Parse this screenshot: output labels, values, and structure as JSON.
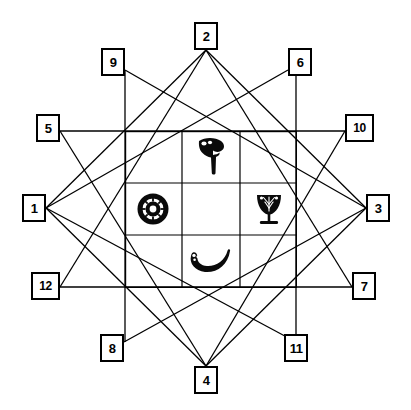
{
  "diagram": {
    "background_color": "#ffffff",
    "line_color": "#000000",
    "box_border_color": "#000000",
    "box_fill_color": "#ffffff"
  },
  "nodes": [
    {
      "id": "node-1",
      "label": "1",
      "x": 22,
      "y": 194,
      "w": 24,
      "h": 28,
      "anchor_x": 46,
      "anchor_y": 208
    },
    {
      "id": "node-2",
      "label": "2",
      "x": 194,
      "y": 22,
      "w": 24,
      "h": 28,
      "anchor_x": 206,
      "anchor_y": 50
    },
    {
      "id": "node-3",
      "label": "3",
      "x": 366,
      "y": 194,
      "w": 24,
      "h": 28,
      "anchor_x": 366,
      "anchor_y": 208
    },
    {
      "id": "node-4",
      "label": "4",
      "x": 194,
      "y": 366,
      "w": 24,
      "h": 28,
      "anchor_x": 206,
      "anchor_y": 366
    },
    {
      "id": "node-5",
      "label": "5",
      "x": 36,
      "y": 114,
      "w": 24,
      "h": 28,
      "anchor_x": 60,
      "anchor_y": 131
    },
    {
      "id": "node-6",
      "label": "6",
      "x": 288,
      "y": 48,
      "w": 24,
      "h": 28,
      "anchor_x": 288,
      "anchor_y": 70
    },
    {
      "id": "node-7",
      "label": "7",
      "x": 352,
      "y": 272,
      "w": 24,
      "h": 28,
      "anchor_x": 352,
      "anchor_y": 287
    },
    {
      "id": "node-8",
      "label": "8",
      "x": 100,
      "y": 334,
      "w": 24,
      "h": 28,
      "anchor_x": 124,
      "anchor_y": 342
    },
    {
      "id": "node-9",
      "label": "9",
      "x": 101,
      "y": 48,
      "w": 24,
      "h": 28,
      "anchor_x": 125,
      "anchor_y": 70
    },
    {
      "id": "node-10",
      "label": "10",
      "x": 345,
      "y": 114,
      "w": 29,
      "h": 28,
      "anchor_x": 345,
      "anchor_y": 131
    },
    {
      "id": "node-11",
      "label": "11",
      "x": 284,
      "y": 334,
      "w": 24,
      "h": 28,
      "anchor_x": 296,
      "anchor_y": 342
    },
    {
      "id": "node-12",
      "label": "12",
      "x": 31,
      "y": 272,
      "w": 29,
      "h": 28,
      "anchor_x": 60,
      "anchor_y": 287
    }
  ],
  "connections": [
    {
      "from": "5",
      "to": "10",
      "kind": "horizontal"
    },
    {
      "from": "12",
      "to": "7",
      "kind": "horizontal"
    },
    {
      "from": "9",
      "to": "8",
      "kind": "vertical"
    },
    {
      "from": "6",
      "to": "11",
      "kind": "vertical"
    },
    {
      "from": "1",
      "to": "6",
      "kind": "diagonal"
    },
    {
      "from": "1",
      "to": "11",
      "kind": "diagonal"
    },
    {
      "from": "3",
      "to": "9",
      "kind": "diagonal"
    },
    {
      "from": "3",
      "to": "8",
      "kind": "diagonal"
    },
    {
      "from": "2",
      "to": "7",
      "kind": "diagonal"
    },
    {
      "from": "2",
      "to": "12",
      "kind": "diagonal"
    },
    {
      "from": "4",
      "to": "5",
      "kind": "diagonal"
    },
    {
      "from": "4",
      "to": "10",
      "kind": "diagonal"
    },
    {
      "from": "1",
      "to": "2",
      "kind": "square-side"
    },
    {
      "from": "2",
      "to": "3",
      "kind": "square-side"
    },
    {
      "from": "3",
      "to": "4",
      "kind": "square-side"
    },
    {
      "from": "4",
      "to": "1",
      "kind": "square-side"
    }
  ],
  "grid": {
    "x": 125,
    "y": 131,
    "width": 164,
    "height": 156,
    "rows": 3,
    "cols": 3,
    "border_color": "#000000",
    "cells": [
      {
        "row": 0,
        "col": 0,
        "symbol": ""
      },
      {
        "row": 0,
        "col": 1,
        "symbol": "hammer-icon"
      },
      {
        "row": 0,
        "col": 2,
        "symbol": ""
      },
      {
        "row": 1,
        "col": 0,
        "symbol": "rosette-wheel-icon"
      },
      {
        "row": 1,
        "col": 1,
        "symbol": ""
      },
      {
        "row": 1,
        "col": 2,
        "symbol": "goblet-tree-icon"
      },
      {
        "row": 2,
        "col": 0,
        "symbol": ""
      },
      {
        "row": 2,
        "col": 1,
        "symbol": "crescent-horn-icon"
      },
      {
        "row": 2,
        "col": 2,
        "symbol": ""
      }
    ]
  },
  "symbols": [
    {
      "name": "hammer-icon",
      "position": "top-center",
      "description": "hammer / adze shape"
    },
    {
      "name": "rosette-wheel-icon",
      "position": "middle-left",
      "description": "spoked wheel rosette"
    },
    {
      "name": "goblet-tree-icon",
      "position": "middle-right",
      "description": "goblet with sprig"
    },
    {
      "name": "crescent-horn-icon",
      "position": "bottom-center",
      "description": "crescent horn"
    }
  ]
}
